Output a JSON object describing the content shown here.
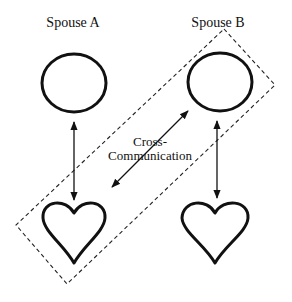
{
  "diagram": {
    "labels": {
      "spouse_a": "Spouse A",
      "spouse_b": "Spouse B",
      "cross_line1": "Cross-",
      "cross_line2": "Communication"
    },
    "nodes": [
      {
        "id": "head-a",
        "shape": "circle",
        "owner": "Spouse A"
      },
      {
        "id": "head-b",
        "shape": "circle",
        "owner": "Spouse B"
      },
      {
        "id": "heart-a",
        "shape": "heart",
        "owner": "Spouse A"
      },
      {
        "id": "heart-b",
        "shape": "heart",
        "owner": "Spouse B"
      }
    ],
    "edges": [
      {
        "from": "head-a",
        "to": "heart-a",
        "style": "double-arrow"
      },
      {
        "from": "head-b",
        "to": "heart-b",
        "style": "double-arrow"
      },
      {
        "from": "head-b",
        "to": "heart-a",
        "style": "double-arrow",
        "label": "Cross-Communication"
      }
    ],
    "grouping": {
      "style": "dashed-rectangle",
      "encloses": [
        "head-b",
        "heart-a"
      ]
    },
    "colors": {
      "stroke": "#111111",
      "background": "#ffffff"
    }
  }
}
